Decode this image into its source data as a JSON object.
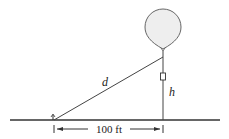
{
  "diagram": {
    "type": "balloon-height-problem",
    "labels": {
      "hypotenuse": "d",
      "height": "h",
      "base_distance": "100 ft"
    },
    "colors": {
      "stroke": "#333333",
      "balloon_fill": "#eeeeee",
      "background": "#ffffff"
    }
  }
}
